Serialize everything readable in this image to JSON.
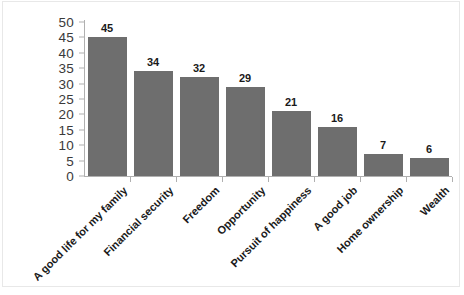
{
  "chart": {
    "title": "",
    "bar_color": "#6e6e6e",
    "axis_color": "#b0b0b0"
  },
  "chart_data": {
    "type": "bar",
    "title": "",
    "xlabel": "",
    "ylabel": "",
    "ylim": [
      0,
      50
    ],
    "yticks": [
      0,
      5,
      10,
      15,
      20,
      25,
      30,
      35,
      40,
      45,
      50
    ],
    "grid": false,
    "legend": false,
    "categories": [
      "A good life for my family",
      "Financial security",
      "Freedom",
      "Opportunity",
      "Pursuit of happiness",
      "A good job",
      "Home ownership",
      "Wealth"
    ],
    "values": [
      45,
      34,
      32,
      29,
      21,
      16,
      7,
      6
    ],
    "data_labels": [
      "45",
      "34",
      "32",
      "29",
      "21",
      "16",
      "7",
      "6"
    ]
  },
  "y_axis": {
    "ticks": [
      "50",
      "45",
      "40",
      "35",
      "30",
      "25",
      "20",
      "15",
      "10",
      "5",
      "0"
    ]
  }
}
